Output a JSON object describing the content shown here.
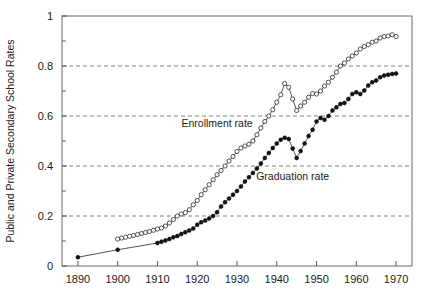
{
  "chart_data": {
    "type": "line",
    "title": "",
    "subtitle": "",
    "xlabel": "",
    "ylabel": "Public and Private Secondary School Rates",
    "xlim": [
      1886,
      1974
    ],
    "ylim": [
      0,
      1
    ],
    "xticks": [
      1890,
      1900,
      1910,
      1920,
      1930,
      1940,
      1950,
      1960,
      1970
    ],
    "xtick_labels": [
      "1890",
      "1900",
      "1910",
      "1920",
      "1930",
      "1940",
      "1950",
      "1960",
      "1970"
    ],
    "yticks": [
      0,
      0.2,
      0.4,
      0.6,
      0.8,
      1
    ],
    "ytick_labels": [
      "0",
      "0.2",
      "0.4",
      "0.6",
      "0.8",
      "1"
    ],
    "yticks_minor": [
      0.1,
      0.3,
      0.5,
      0.7,
      0.9
    ],
    "gridlines_y": [
      0.2,
      0.4,
      0.6,
      0.8
    ],
    "grid": true,
    "grid_style": "dashed-horizontal",
    "legend_position": "inline-annotations",
    "annotations": [
      {
        "text": "Enrollment rate",
        "x": 1925,
        "y": 0.555
      },
      {
        "text": "Graduation rate",
        "x": 1944,
        "y": 0.345
      }
    ],
    "series": [
      {
        "name": "Enrollment rate",
        "marker": "open-circle",
        "color": "#2b2b2b",
        "x": [
          1900,
          1901,
          1902,
          1903,
          1904,
          1905,
          1906,
          1907,
          1908,
          1909,
          1910,
          1911,
          1912,
          1913,
          1914,
          1915,
          1916,
          1917,
          1918,
          1919,
          1920,
          1921,
          1922,
          1923,
          1924,
          1925,
          1926,
          1927,
          1928,
          1929,
          1930,
          1931,
          1932,
          1933,
          1934,
          1935,
          1936,
          1937,
          1938,
          1939,
          1940,
          1941,
          1942,
          1943,
          1944,
          1945,
          1946,
          1947,
          1948,
          1949,
          1950,
          1951,
          1952,
          1953,
          1954,
          1955,
          1956,
          1957,
          1958,
          1959,
          1960,
          1961,
          1962,
          1963,
          1964,
          1965,
          1966,
          1967,
          1968,
          1969,
          1970
        ],
        "y": [
          0.108,
          0.112,
          0.115,
          0.119,
          0.122,
          0.126,
          0.13,
          0.134,
          0.138,
          0.143,
          0.148,
          0.152,
          0.16,
          0.172,
          0.186,
          0.2,
          0.208,
          0.213,
          0.225,
          0.245,
          0.262,
          0.285,
          0.305,
          0.325,
          0.345,
          0.365,
          0.382,
          0.4,
          0.42,
          0.438,
          0.458,
          0.472,
          0.48,
          0.487,
          0.5,
          0.525,
          0.552,
          0.578,
          0.6,
          0.625,
          0.655,
          0.685,
          0.73,
          0.715,
          0.668,
          0.622,
          0.64,
          0.655,
          0.675,
          0.69,
          0.688,
          0.7,
          0.72,
          0.735,
          0.755,
          0.775,
          0.8,
          0.812,
          0.828,
          0.84,
          0.852,
          0.868,
          0.878,
          0.885,
          0.895,
          0.9,
          0.912,
          0.918,
          0.92,
          0.925,
          0.918
        ]
      },
      {
        "name": "Graduation rate",
        "marker": "filled-circle",
        "color": "#121212",
        "x": [
          1890,
          1900,
          1910,
          1911,
          1912,
          1913,
          1914,
          1915,
          1916,
          1917,
          1918,
          1919,
          1920,
          1921,
          1922,
          1923,
          1924,
          1925,
          1926,
          1927,
          1928,
          1929,
          1930,
          1931,
          1932,
          1933,
          1934,
          1935,
          1936,
          1937,
          1938,
          1939,
          1940,
          1941,
          1942,
          1943,
          1944,
          1945,
          1946,
          1947,
          1948,
          1949,
          1950,
          1951,
          1952,
          1953,
          1954,
          1955,
          1956,
          1957,
          1958,
          1959,
          1960,
          1961,
          1962,
          1963,
          1964,
          1965,
          1966,
          1967,
          1968,
          1969,
          1970
        ],
        "y": [
          0.035,
          0.065,
          0.092,
          0.097,
          0.102,
          0.108,
          0.115,
          0.12,
          0.128,
          0.135,
          0.142,
          0.15,
          0.165,
          0.175,
          0.182,
          0.19,
          0.2,
          0.215,
          0.238,
          0.255,
          0.27,
          0.285,
          0.3,
          0.318,
          0.338,
          0.355,
          0.372,
          0.39,
          0.41,
          0.432,
          0.452,
          0.472,
          0.49,
          0.505,
          0.513,
          0.508,
          0.47,
          0.432,
          0.46,
          0.49,
          0.52,
          0.545,
          0.578,
          0.592,
          0.585,
          0.6,
          0.622,
          0.635,
          0.648,
          0.652,
          0.668,
          0.688,
          0.695,
          0.688,
          0.702,
          0.722,
          0.735,
          0.742,
          0.755,
          0.762,
          0.765,
          0.768,
          0.77
        ]
      }
    ]
  }
}
